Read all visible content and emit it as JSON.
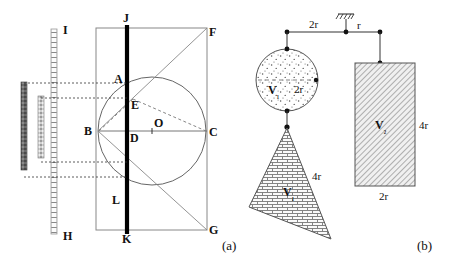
{
  "figure": {
    "caption_a": "(a)",
    "caption_b": "(b)",
    "background": "#ffffff",
    "stroke": "#555555",
    "bold_stroke": "#000000"
  },
  "panel_a": {
    "name": "optical-geometry-construction",
    "labels": {
      "A": "A",
      "B": "B",
      "C": "C",
      "D": "D",
      "E": "E",
      "F": "F",
      "G": "G",
      "H": "H",
      "I": "I",
      "J": "J",
      "K": "K",
      "L": "L",
      "O": "O"
    },
    "elements": {
      "rectangle": "BFGC bounding rectangle",
      "circle": "inscribed circle centered at O",
      "vertical_bar": "thick black bar J-K",
      "hatched_screen": "I-H hatched vertical strip",
      "dark_bar": "solid dark vertical bar left",
      "small_bar": "small stippled vertical bar",
      "projection_lines": 4,
      "diagonals": [
        "B-F",
        "B-G",
        "B-E-C dashed"
      ]
    }
  },
  "panel_b": {
    "name": "lever-balance-diagram",
    "beam": {
      "left_arm_label": "2r",
      "right_arm_label": "r",
      "fulcrum": "hatched-support"
    },
    "sphere": {
      "volume_label": "V",
      "volume_sub": "₁",
      "diameter_label": "2r",
      "fill": "stipple"
    },
    "triangle": {
      "volume_label": "V",
      "volume_sub": "₁",
      "side_label": "4r",
      "fill": "brick"
    },
    "rectangle": {
      "volume_label": "V",
      "volume_sub": "₂",
      "height_label": "4r",
      "width_label": "2r",
      "fill": "diagonal-hatch"
    }
  }
}
